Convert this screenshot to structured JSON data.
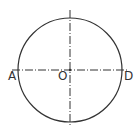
{
  "diagram": {
    "type": "circle-with-center-lines",
    "colors": {
      "stroke": "#333333",
      "background": "#ffffff"
    },
    "circle": {
      "center": "O",
      "cx": 70,
      "cy": 70,
      "r": 52
    },
    "points": [
      {
        "label": "A",
        "x": 18,
        "y": 70,
        "label_x": 8,
        "label_y": 80
      },
      {
        "label": "O",
        "x": 70,
        "y": 70,
        "label_x": 58,
        "label_y": 80
      },
      {
        "label": "D",
        "x": 122,
        "y": 70,
        "label_x": 124,
        "label_y": 80
      }
    ],
    "axes": {
      "horizontal": {
        "x1": 12,
        "y1": 70,
        "x2": 127,
        "y2": 70,
        "style": "dash-dot"
      },
      "vertical": {
        "x1": 70,
        "y1": 10,
        "x2": 70,
        "y2": 127,
        "style": "dash-dot"
      }
    }
  }
}
